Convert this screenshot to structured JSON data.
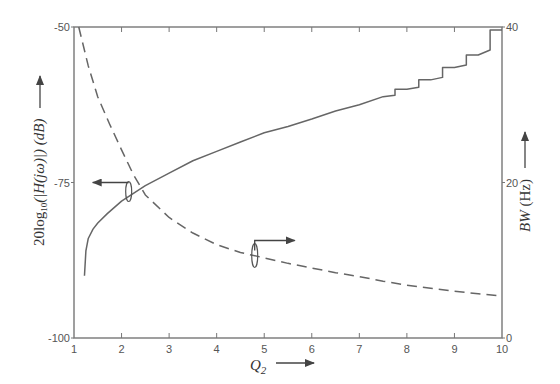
{
  "chart_data": {
    "type": "line",
    "title": "",
    "xlabel": "Q2",
    "ylabel": "20log10(|H(jω)|) (dB)",
    "ylabel_right": "BW (Hz)",
    "xlim": [
      1,
      10
    ],
    "ylim": [
      -100,
      -50
    ],
    "ylim_right": [
      0,
      40
    ],
    "x_ticks": [
      "1",
      "2",
      "3",
      "4",
      "5",
      "6",
      "7",
      "8",
      "9",
      "10"
    ],
    "y_ticks_left": [
      "-100",
      "-75",
      "-50"
    ],
    "y_ticks_right": [
      "0",
      "20",
      "40"
    ],
    "grid": false,
    "legend": "none (curves identified by annotation arrows pointing to respective axes)",
    "series": [
      {
        "name": "20log10(|H(jω)|) (dB)",
        "axis": "left",
        "style": "solid",
        "x": [
          1.22,
          1.25,
          1.3,
          1.4,
          1.5,
          1.7,
          2.0,
          2.5,
          3.0,
          3.5,
          4.0,
          4.5,
          5.0,
          5.5,
          6.0,
          6.5,
          7.0,
          7.5,
          8.0,
          8.5,
          9.0,
          9.5,
          10.0
        ],
        "y": [
          -90.0,
          -86.0,
          -84.0,
          -82.5,
          -81.5,
          -80.0,
          -78.0,
          -75.5,
          -73.5,
          -71.5,
          -70.0,
          -68.5,
          -67.0,
          -66.0,
          -64.8,
          -63.5,
          -62.5,
          -61.2,
          -60.0,
          -58.5,
          -56.5,
          -54.5,
          -50.5
        ]
      },
      {
        "name": "BW (Hz)",
        "axis": "right",
        "style": "dashed",
        "x": [
          1.1,
          1.3,
          1.5,
          1.75,
          2.0,
          2.25,
          2.5,
          3.0,
          3.5,
          4.0,
          4.5,
          5.0,
          5.5,
          6.0,
          6.5,
          7.0,
          7.5,
          8.0,
          8.5,
          9.0,
          9.5,
          10.0
        ],
        "y": [
          40.0,
          35.0,
          31.0,
          27.5,
          24.2,
          21.0,
          18.4,
          15.5,
          13.5,
          12.0,
          11.0,
          10.3,
          9.6,
          9.0,
          8.4,
          7.9,
          7.3,
          6.8,
          6.4,
          6.0,
          5.7,
          5.4
        ]
      }
    ],
    "annotations": [
      {
        "text": "arrow pointing left to dB axis",
        "at": {
          "x": 2.15,
          "y": -75
        }
      },
      {
        "text": "arrow pointing right to BW axis",
        "at": {
          "x": 4.8,
          "y_right": 11
        }
      }
    ]
  },
  "axes": {
    "x_label_main": "Q",
    "x_label_sub": "2",
    "left_label": "20log",
    "left_label_sub": "10",
    "left_label_rest": "(|H(jω)|) (dB)",
    "right_label_italic": "BW",
    "right_label_rest": " (Hz)"
  },
  "colors": {
    "line": "#666666",
    "frame": "#777777",
    "text": "#444444"
  }
}
